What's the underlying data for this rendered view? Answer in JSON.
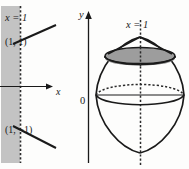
{
  "figure": {
    "background_color": "#fdfdfc",
    "ink_color": "#1a1a1a",
    "shade_color": "#b9b9b9",
    "disk_color": "#9d9d9d"
  },
  "left_panel": {
    "name": "plane-region-graph",
    "labels": {
      "line_x_equals_1": "x = 1",
      "point_upper": "(1, 1)",
      "point_lower": "(1, −1)",
      "x_axis": "x"
    },
    "geometry": {
      "vertical_dashed_line_x": 20,
      "x_axis_y": 86,
      "shaded_strip_x_range": [
        1,
        20
      ],
      "upper_line_point": [
        20,
        37
      ],
      "lower_line_point": [
        20,
        124
      ]
    }
  },
  "right_panel": {
    "name": "solid-of-revolution-graph",
    "labels": {
      "y_axis": "y",
      "origin": "0",
      "axis_of_revolution": "x = 1"
    },
    "geometry": {
      "y_axis_x": 88,
      "origin_y": 95,
      "axis_of_revolution_x": 140,
      "solid_center": [
        140,
        95
      ],
      "solid_radius_x": 44,
      "solid_radius_y": 44,
      "apex_top_y": 37,
      "apex_bottom_y": 153,
      "cross_section_disk_y": 58,
      "cross_section_disk_rx": 35,
      "cross_section_disk_ry": 8
    }
  }
}
